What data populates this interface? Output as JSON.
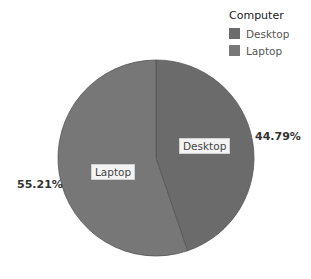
{
  "chart_data": {
    "type": "pie",
    "title": "",
    "legend_title": "Computer",
    "legend_position": "top-right",
    "categories": [
      "Desktop",
      "Laptop"
    ],
    "values": [
      44.79,
      55.21
    ],
    "value_labels": [
      "44.79%",
      "55.21%"
    ],
    "colors": [
      "#6b6b6b",
      "#777777"
    ],
    "start_angle_deg": 0,
    "direction": "clockwise"
  },
  "legend": {
    "title": "Computer",
    "items": [
      {
        "label": "Desktop",
        "color": "#6b6b6b"
      },
      {
        "label": "Laptop",
        "color": "#777777"
      }
    ]
  },
  "labels": {
    "desktop_inner": "Desktop",
    "laptop_inner": "Laptop",
    "desktop_pct": "44.79%",
    "laptop_pct": "55.21%"
  }
}
